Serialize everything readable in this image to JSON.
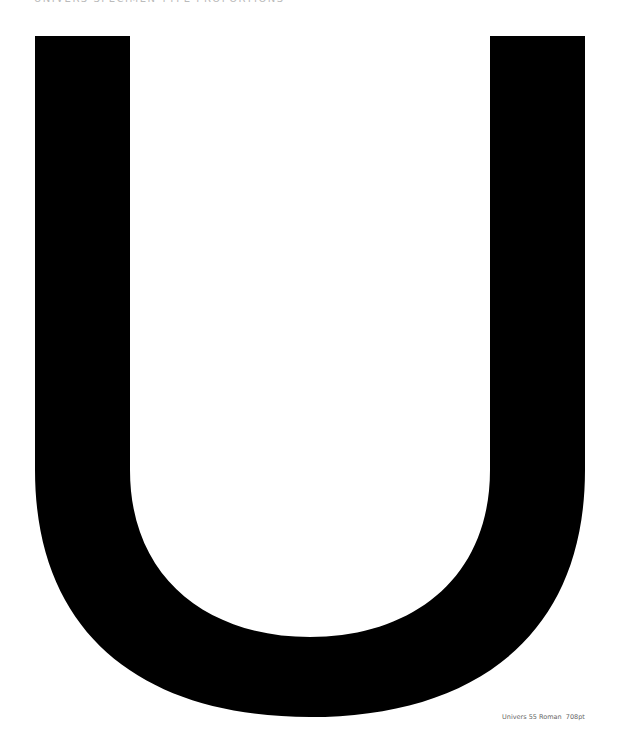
{
  "header": {
    "text": "UNIVERS SPECIMEN TYPE PROPORTIONS"
  },
  "specimen": {
    "glyph": "U",
    "color": "#000000",
    "background": "#ffffff"
  },
  "caption": {
    "text": "Univers 55 Roman  708pt"
  }
}
